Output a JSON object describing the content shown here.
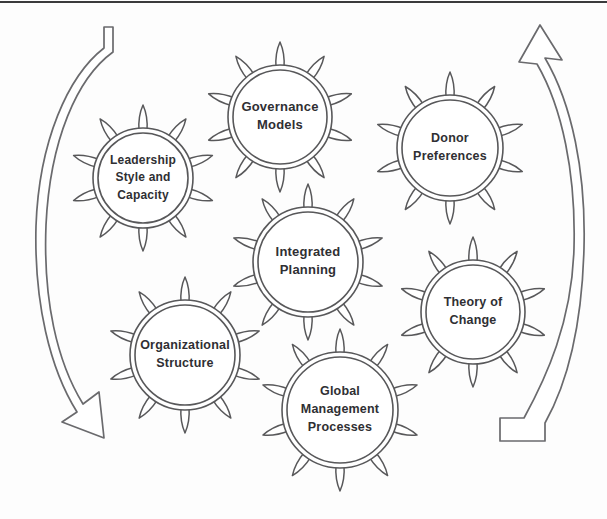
{
  "diagram": {
    "type": "cycle-diagram",
    "background_color": "#fdfdfd",
    "line_color": "#58585a",
    "text_color": "#2f2f33",
    "arrow_color": "#6a6a6d",
    "node_shape": "spiked-circle",
    "spike_count": 10,
    "nodes": [
      {
        "id": "governance-models",
        "label": "Governance Models",
        "lines": [
          "Governance",
          "Models"
        ],
        "cx": 280,
        "cy": 117,
        "r": 52,
        "font_size": 13
      },
      {
        "id": "leadership-style-and-capacity",
        "label": "Leadership Style and Capacity",
        "lines": [
          "Leadership",
          "Style and",
          "Capacity"
        ],
        "cx": 143,
        "cy": 178,
        "r": 50,
        "font_size": 12
      },
      {
        "id": "donor-preferences",
        "label": "Donor Preferences",
        "lines": [
          "Donor",
          "Preferences"
        ],
        "cx": 450,
        "cy": 148,
        "r": 53,
        "font_size": 12.5
      },
      {
        "id": "integrated-planning",
        "label": "Integrated Planning",
        "lines": [
          "Integrated",
          "Planning"
        ],
        "cx": 308,
        "cy": 262,
        "r": 55,
        "font_size": 13
      },
      {
        "id": "theory-of-change",
        "label": "Theory of Change",
        "lines": [
          "Theory of",
          "Change"
        ],
        "cx": 473,
        "cy": 312,
        "r": 52,
        "font_size": 12.5
      },
      {
        "id": "organizational-structure",
        "label": "Organizational Structure",
        "lines": [
          "Organizational",
          "Structure"
        ],
        "cx": 185,
        "cy": 355,
        "r": 55,
        "font_size": 12.5
      },
      {
        "id": "global-management-processes",
        "label": "Global Management Processes",
        "lines": [
          "Global",
          "Management",
          "Processes"
        ],
        "cx": 340,
        "cy": 410,
        "r": 58,
        "font_size": 12.5
      }
    ],
    "arrows": [
      {
        "id": "left-cycle-arrow",
        "name": "left-curved-arrow-downward",
        "direction": "clockwise-down",
        "head_position": "bottom",
        "tail_position": "top"
      },
      {
        "id": "right-cycle-arrow",
        "name": "right-curved-arrow-upward",
        "direction": "counterclockwise-up",
        "head_position": "top",
        "tail_position": "bottom"
      }
    ]
  }
}
